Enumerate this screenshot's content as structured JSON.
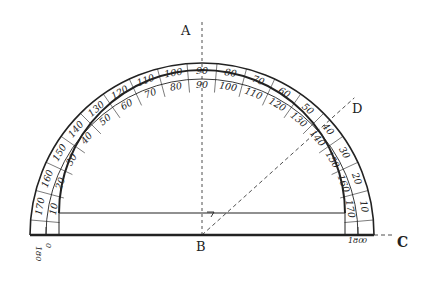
{
  "diagram": {
    "center": {
      "x": 202,
      "y": 235
    },
    "radii": {
      "outer": 172,
      "middle": 156,
      "inner": 143
    },
    "inner_bar_y": 213,
    "points": {
      "A": {
        "label": "A",
        "x": 186,
        "y": 35
      },
      "B": {
        "label": "B",
        "x": 201,
        "y": 251
      },
      "C": {
        "label": "C",
        "x": 401,
        "y": 247
      },
      "D": {
        "label": "D",
        "x": 353,
        "y": 113
      }
    },
    "outer_scale": [
      "10",
      "20",
      "30",
      "40",
      "50",
      "60",
      "70",
      "80",
      "90",
      "100",
      "110",
      "120",
      "130",
      "140",
      "150",
      "160",
      "170"
    ],
    "inner_scale": [
      "10",
      "20",
      "30",
      "40",
      "50",
      "60",
      "70",
      "80",
      "90",
      "100",
      "110",
      "120",
      "130",
      "140",
      "150",
      "160",
      "170"
    ],
    "end_labels": {
      "left_outer": "180",
      "left_inner": "0",
      "right_outer": "0",
      "right_inner": "180"
    },
    "line_BD_angle_deg": 42,
    "colors": {
      "ink": "#222222",
      "background": "#ffffff"
    }
  }
}
